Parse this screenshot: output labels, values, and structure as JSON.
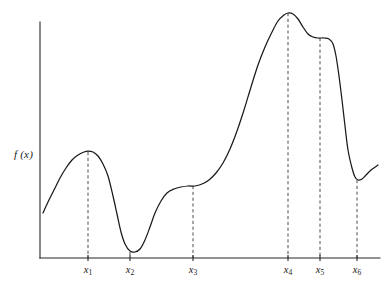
{
  "figure": {
    "background_color": "#ffffff",
    "curve_color": "#1a1a1a",
    "axis_color": "#262626",
    "guide_color": "#3a3a3a",
    "y_axis_label": "f (x)",
    "y_axis_label_plain": "f(x)"
  },
  "axes": {
    "x_axis": {
      "x1": 40,
      "x2": 380,
      "y": 258
    },
    "y_axis": {
      "x": 40,
      "y1": 22,
      "y2": 258
    },
    "x_range_px": [
      40,
      380
    ],
    "y_range_px": [
      258,
      13
    ],
    "grid": false,
    "legend": false
  },
  "ticks": [
    {
      "id": "x1",
      "var": "x",
      "sub": "1",
      "x_px": 88
    },
    {
      "id": "x2",
      "var": "x",
      "sub": "2",
      "x_px": 130
    },
    {
      "id": "x3",
      "var": "x",
      "sub": "3",
      "x_px": 193
    },
    {
      "id": "x4",
      "var": "x",
      "sub": "4",
      "x_px": 288
    },
    {
      "id": "x5",
      "var": "x",
      "sub": "5",
      "x_px": 320
    },
    {
      "id": "x6",
      "var": "x",
      "sub": "6",
      "x_px": 357
    }
  ],
  "chart_data": {
    "type": "line",
    "title": "",
    "subtitle": "",
    "xlabel": "",
    "ylabel": "f(x)",
    "grid": false,
    "legend_position": "none",
    "axis_ranges": {
      "x_px": [
        40,
        380
      ],
      "y_px_baseline": 258,
      "y_px_top": 13
    },
    "xtick_labels": [
      "x1",
      "x2",
      "x3",
      "x4",
      "x5",
      "x6"
    ],
    "ytick_labels": [],
    "annotations": [
      {
        "label": "x1",
        "type": "local-maximum",
        "x_px": 88,
        "y_px": 152
      },
      {
        "label": "x2",
        "type": "local-minimum",
        "x_px": 130,
        "y_px": 252
      },
      {
        "label": "x3",
        "type": "saddle-inflection-plateau",
        "x_px": 193,
        "y_px": 186
      },
      {
        "label": "x4",
        "type": "global-maximum",
        "x_px": 288,
        "y_px": 13
      },
      {
        "label": "x5",
        "type": "local-maximum-plateau",
        "x_px": 320,
        "y_px": 38
      },
      {
        "label": "x6",
        "type": "local-minimum",
        "x_px": 357,
        "y_px": 180
      }
    ],
    "series": [
      {
        "name": "f(x)",
        "points_px": [
          [
            43,
            213
          ],
          [
            48,
            202
          ],
          [
            54,
            190
          ],
          [
            60,
            178
          ],
          [
            66,
            168
          ],
          [
            72,
            160
          ],
          [
            78,
            155
          ],
          [
            84,
            152
          ],
          [
            88,
            151
          ],
          [
            93,
            152
          ],
          [
            98,
            156
          ],
          [
            103,
            164
          ],
          [
            108,
            176
          ],
          [
            113,
            196
          ],
          [
            117,
            214
          ],
          [
            121,
            232
          ],
          [
            125,
            244
          ],
          [
            130,
            251
          ],
          [
            135,
            252
          ],
          [
            140,
            249
          ],
          [
            145,
            240
          ],
          [
            150,
            227
          ],
          [
            155,
            213
          ],
          [
            161,
            201
          ],
          [
            167,
            193
          ],
          [
            174,
            189
          ],
          [
            181,
            187
          ],
          [
            188,
            186
          ],
          [
            195,
            186
          ],
          [
            202,
            184
          ],
          [
            209,
            180
          ],
          [
            216,
            173
          ],
          [
            223,
            163
          ],
          [
            230,
            149
          ],
          [
            237,
            131
          ],
          [
            244,
            110
          ],
          [
            251,
            87
          ],
          [
            258,
            65
          ],
          [
            265,
            47
          ],
          [
            272,
            32
          ],
          [
            278,
            21
          ],
          [
            284,
            15
          ],
          [
            288,
            13
          ],
          [
            293,
            14
          ],
          [
            298,
            19
          ],
          [
            303,
            27
          ],
          [
            308,
            34
          ],
          [
            313,
            37
          ],
          [
            318,
            38
          ],
          [
            324,
            38
          ],
          [
            329,
            39
          ],
          [
            333,
            44
          ],
          [
            336,
            56
          ],
          [
            339,
            76
          ],
          [
            342,
            100
          ],
          [
            345,
            126
          ],
          [
            348,
            150
          ],
          [
            352,
            168
          ],
          [
            355,
            177
          ],
          [
            358,
            180
          ],
          [
            362,
            179
          ],
          [
            366,
            175
          ],
          [
            371,
            170
          ],
          [
            378,
            165
          ]
        ]
      }
    ]
  }
}
